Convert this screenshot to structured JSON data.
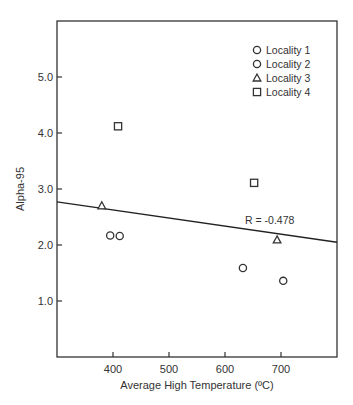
{
  "chart_data": {
    "type": "scatter",
    "title": "",
    "xlabel": "Average High Temperature (ºC)",
    "ylabel": "Alpha-95",
    "xlim": [
      300,
      800
    ],
    "ylim": [
      0,
      6
    ],
    "xticks": [
      400,
      500,
      600,
      700
    ],
    "xtick_labels": [
      "400",
      "500",
      "600",
      "700"
    ],
    "yticks": [
      1.0,
      2.0,
      3.0,
      4.0,
      5.0
    ],
    "ytick_labels": [
      "1.0",
      "2.0",
      "3.0",
      "4.0",
      "5.0"
    ],
    "grid": false,
    "legend_position": "upper right",
    "series": [
      {
        "name": "Locality 1",
        "marker": "circle",
        "points": [
          {
            "x": 412,
            "y": 2.16
          },
          {
            "x": 632,
            "y": 1.59
          }
        ]
      },
      {
        "name": "Locality 2",
        "marker": "circle",
        "points": [
          {
            "x": 395,
            "y": 2.17
          },
          {
            "x": 704,
            "y": 1.36
          }
        ]
      },
      {
        "name": "Locality 3",
        "marker": "triangle",
        "points": [
          {
            "x": 380,
            "y": 2.7
          },
          {
            "x": 693,
            "y": 2.09
          }
        ]
      },
      {
        "name": "Locality 4",
        "marker": "square",
        "points": [
          {
            "x": 409,
            "y": 4.12
          },
          {
            "x": 652,
            "y": 3.11
          }
        ]
      }
    ],
    "regression_line": {
      "x": [
        300,
        800
      ],
      "y": [
        2.77,
        2.05
      ]
    },
    "annotations": [
      {
        "text": "R = -0.478",
        "x": 680,
        "y": 2.45
      }
    ]
  },
  "legend": {
    "items": [
      {
        "label": "Locality 1",
        "marker": "circle"
      },
      {
        "label": "Locality 2",
        "marker": "circle"
      },
      {
        "label": "Locality 3",
        "marker": "triangle"
      },
      {
        "label": "Locality 4",
        "marker": "square"
      }
    ]
  },
  "annotation_text": "R = -0.478",
  "axes": {
    "xlabel": "Average High Temperature (ºC)",
    "ylabel": "Alpha-95"
  }
}
